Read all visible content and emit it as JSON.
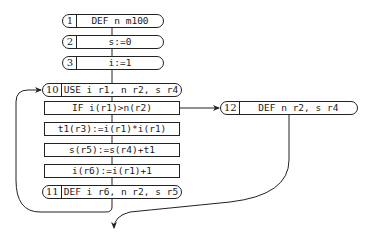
{
  "diagram": {
    "type": "control-flow-graph",
    "nodes": [
      {
        "id": "1",
        "number": "1",
        "label": "DEF n m100",
        "shape": "rounded"
      },
      {
        "id": "2",
        "number": "2",
        "label": "s:=0",
        "shape": "rounded"
      },
      {
        "id": "3",
        "number": "3",
        "label": "i:=1",
        "shape": "rounded"
      },
      {
        "id": "10",
        "number": "10",
        "label": "USE i r1, n r2, s r4",
        "shape": "rounded"
      },
      {
        "id": "if",
        "label": "IF i(r1)>n(r2)",
        "shape": "rect"
      },
      {
        "id": "t1",
        "label": "t1(r3):=i(r1)*i(r1)",
        "shape": "rect"
      },
      {
        "id": "s",
        "label": "s(r5):=s(r4)+t1",
        "shape": "rect"
      },
      {
        "id": "i",
        "label": "i(r6):=i(r1)+1",
        "shape": "rect"
      },
      {
        "id": "11",
        "number": "11",
        "label": "DEF i r6, n r2, s r5",
        "shape": "rounded"
      },
      {
        "id": "12",
        "number": "12",
        "label": "DEF n r2, s r4",
        "shape": "rounded"
      }
    ],
    "edges": [
      {
        "from": "1",
        "to": "2"
      },
      {
        "from": "2",
        "to": "3"
      },
      {
        "from": "3",
        "to": "10"
      },
      {
        "from": "10",
        "to": "if"
      },
      {
        "from": "if",
        "to": "t1"
      },
      {
        "from": "t1",
        "to": "s"
      },
      {
        "from": "s",
        "to": "i"
      },
      {
        "from": "i",
        "to": "11"
      },
      {
        "from": "11",
        "to": "10",
        "kind": "loop-back"
      },
      {
        "from": "if",
        "to": "12",
        "kind": "branch"
      },
      {
        "from": "12",
        "to": "exit",
        "kind": "curve-down"
      }
    ],
    "colors": {
      "stroke": "#222222",
      "background": "#ffffff",
      "text": "#1a1a1a"
    }
  }
}
